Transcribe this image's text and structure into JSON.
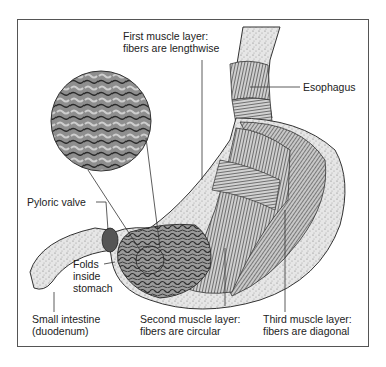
{
  "diagram": {
    "labels": {
      "first_layer_line1": "First muscle layer:",
      "first_layer_line2": "fibers are lengthwise",
      "esophagus": "Esophagus",
      "pyloric_valve": "Pyloric valve",
      "folds_line1": "Folds",
      "folds_line2": "inside",
      "folds_line3": "stomach",
      "small_intestine_line1": "Small intestine",
      "small_intestine_line2": "(duodenum)",
      "second_layer_line1": "Second muscle layer:",
      "second_layer_line2": "fibers are circular",
      "third_layer_line1": "Third muscle layer:",
      "third_layer_line2": "fibers are diagonal"
    },
    "colors": {
      "line": "#333333",
      "frame": "#555555",
      "tissue": "#bdbdbd",
      "muscle": "#8a8a8a",
      "dark": "#444444"
    }
  }
}
